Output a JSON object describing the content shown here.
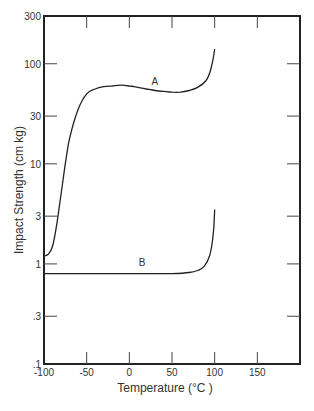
{
  "chart_data": {
    "type": "line",
    "title": "",
    "xlabel": "Temperature (°C )",
    "ylabel": "Impact Strength (cm kg)",
    "xlim": [
      -100,
      200
    ],
    "ylim": [
      0.1,
      300
    ],
    "yscale": "log",
    "grid": false,
    "legend": "none (curves labeled inline)",
    "x_ticks": [
      -100,
      -50,
      0,
      50,
      100,
      150
    ],
    "x_tick_labels": [
      "-100",
      "-50",
      "0",
      "50",
      "100",
      "150"
    ],
    "y_ticks": [
      0.1,
      0.3,
      1,
      3,
      10,
      30,
      100,
      300
    ],
    "y_tick_labels": [
      ".1",
      ".3",
      "1",
      "3",
      "10",
      "30",
      "100",
      "300"
    ],
    "series": [
      {
        "name": "A",
        "x": [
          -100,
          -95,
          -90,
          -85,
          -80,
          -75,
          -70,
          -60,
          -50,
          -40,
          -30,
          -20,
          -10,
          0,
          10,
          20,
          30,
          40,
          50,
          60,
          70,
          80,
          90,
          95,
          98,
          100
        ],
        "values": [
          1.2,
          1.25,
          1.5,
          2.5,
          5,
          10,
          18,
          35,
          50,
          56,
          59,
          60,
          61,
          60,
          58,
          56,
          54,
          53,
          52,
          52,
          54,
          58,
          68,
          85,
          110,
          140
        ]
      },
      {
        "name": "B",
        "x": [
          -100,
          -75,
          -50,
          -25,
          0,
          25,
          50,
          70,
          80,
          88,
          94,
          97,
          99,
          100
        ],
        "values": [
          0.8,
          0.8,
          0.8,
          0.8,
          0.8,
          0.8,
          0.8,
          0.82,
          0.86,
          0.95,
          1.2,
          1.6,
          2.3,
          3.5
        ]
      }
    ],
    "annotations": [
      {
        "text": "A",
        "x": 30,
        "y": 62
      },
      {
        "text": "B",
        "x": 15,
        "y": 0.95
      }
    ]
  }
}
